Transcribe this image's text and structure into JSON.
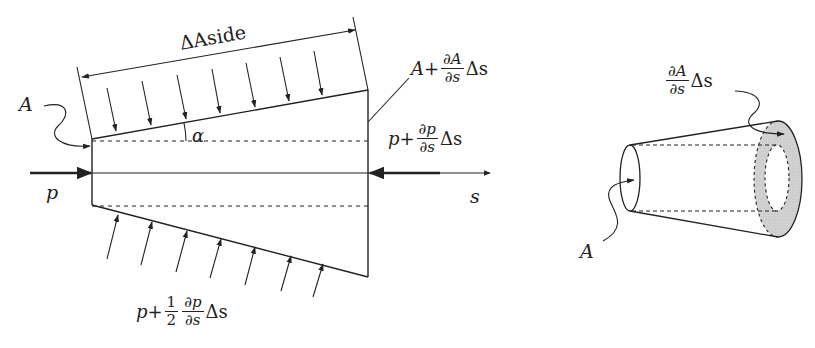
{
  "figure": {
    "left": {
      "dimension_label": "ΔAside",
      "inlet_area_label": "A",
      "inlet_pressure_label": "p",
      "angle_label": "α",
      "axis_label": "s",
      "outlet_area_label": {
        "prefix": "A+",
        "frac_num": "∂A",
        "frac_den": "∂s",
        "suffix": "Δs"
      },
      "outlet_pressure_label": {
        "prefix": "p+",
        "frac_num": "∂p",
        "frac_den": "∂s",
        "suffix": "Δs"
      },
      "side_pressure_label": {
        "prefix": "p+",
        "half_num": "1",
        "half_den": "2",
        "frac_num": "∂p",
        "frac_den": "∂s",
        "suffix": "Δs"
      },
      "top_arrow_count": 7,
      "bottom_arrow_count": 7
    },
    "right": {
      "area_change_label": {
        "frac_num": "∂A",
        "frac_den": "∂s",
        "suffix": "Δs"
      },
      "inlet_area_label": "A",
      "annulus_color": "#cfcfcf"
    },
    "colors": {
      "stroke": "#222222",
      "background": "#ffffff"
    }
  }
}
